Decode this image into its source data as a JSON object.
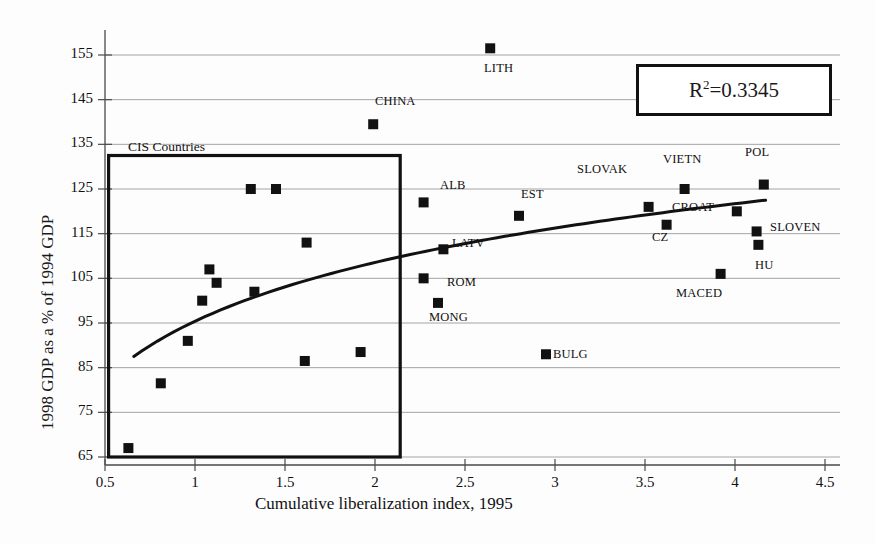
{
  "chart_data": {
    "type": "scatter",
    "title": "",
    "xlabel": "Cumulative liberalization index, 1995",
    "ylabel": "1998 GDP as a % of 1994 GDP",
    "xlim": [
      0.5,
      4.5
    ],
    "ylim": [
      65,
      160
    ],
    "xticks": [
      "0.5",
      "1",
      "1.5",
      "2",
      "2.5",
      "3",
      "3.5",
      "4",
      "4.5"
    ],
    "xtick_values": [
      0.5,
      1,
      1.5,
      2,
      2.5,
      3,
      3.5,
      4,
      4.5
    ],
    "yticks": [
      "65",
      "75",
      "85",
      "95",
      "105",
      "115",
      "125",
      "135",
      "145",
      "155"
    ],
    "ytick_values": [
      65,
      75,
      85,
      95,
      105,
      115,
      125,
      135,
      145,
      155
    ],
    "grid": true,
    "legend": "none",
    "annotations": [
      {
        "name": "r-squared",
        "text": "R²=0.3345",
        "value": 0.3345
      },
      {
        "name": "cis-box-label",
        "text": "CIS Countries"
      }
    ],
    "trendline": {
      "type": "logarithmic",
      "x_start": 0.66,
      "x_end": 4.17,
      "y_start": 87.5,
      "y_end": 122.5,
      "description": "fitted logarithmic trend rising from ~87.5 to ~122.5"
    },
    "highlight_region": {
      "name": "CIS Countries",
      "x_range": [
        0.52,
        2.14
      ],
      "y_range": [
        65,
        132.5
      ]
    },
    "points": [
      {
        "label": "",
        "x": 0.63,
        "y": 67.0
      },
      {
        "label": "",
        "x": 0.81,
        "y": 81.5
      },
      {
        "label": "",
        "x": 0.96,
        "y": 91.0
      },
      {
        "label": "",
        "x": 1.04,
        "y": 100.0
      },
      {
        "label": "",
        "x": 1.08,
        "y": 107.0
      },
      {
        "label": "",
        "x": 1.12,
        "y": 104.0
      },
      {
        "label": "",
        "x": 1.31,
        "y": 125.0
      },
      {
        "label": "",
        "x": 1.33,
        "y": 102.0
      },
      {
        "label": "",
        "x": 1.45,
        "y": 125.0
      },
      {
        "label": "",
        "x": 1.61,
        "y": 86.5
      },
      {
        "label": "",
        "x": 1.62,
        "y": 113.0
      },
      {
        "label": "",
        "x": 1.92,
        "y": 88.5
      },
      {
        "label": "CHINA",
        "x": 1.99,
        "y": 139.5
      },
      {
        "label": "ALB",
        "x": 2.27,
        "y": 122.0
      },
      {
        "label": "ROM",
        "x": 2.27,
        "y": 105.0
      },
      {
        "label": "MONG",
        "x": 2.35,
        "y": 99.5
      },
      {
        "label": "LATV",
        "x": 2.38,
        "y": 111.5
      },
      {
        "label": "LITH",
        "x": 2.64,
        "y": 156.5
      },
      {
        "label": "EST",
        "x": 2.8,
        "y": 119.0
      },
      {
        "label": "BULG",
        "x": 2.95,
        "y": 88.0
      },
      {
        "label": "SLOVAK",
        "x": 3.52,
        "y": 121.0
      },
      {
        "label": "CZ",
        "x": 3.62,
        "y": 117.0
      },
      {
        "label": "VIETN",
        "x": 3.72,
        "y": 125.0
      },
      {
        "label": "MACED",
        "x": 3.92,
        "y": 106.0
      },
      {
        "label": "CROAT",
        "x": 4.01,
        "y": 120.0
      },
      {
        "label": "SLOVEN",
        "x": 4.12,
        "y": 115.5
      },
      {
        "label": "HU",
        "x": 4.13,
        "y": 112.5
      },
      {
        "label": "POL",
        "x": 4.16,
        "y": 126.0
      }
    ],
    "point_labels": [
      {
        "text": "CIS Countries",
        "x_px": 128,
        "y_px": 139
      },
      {
        "text": "LITH",
        "x_px": 484,
        "y_px": 61
      },
      {
        "text": "CHINA",
        "x_px": 375,
        "y_px": 94
      },
      {
        "text": "POL",
        "x_px": 745,
        "y_px": 145
      },
      {
        "text": "SLOVAK",
        "x_px": 577,
        "y_px": 162
      },
      {
        "text": "VIETN",
        "x_px": 663,
        "y_px": 152
      },
      {
        "text": "ALB",
        "x_px": 440,
        "y_px": 178
      },
      {
        "text": "EST",
        "x_px": 521,
        "y_px": 187
      },
      {
        "text": "CROAT",
        "x_px": 672,
        "y_px": 200
      },
      {
        "text": "SLOVEN",
        "x_px": 770,
        "y_px": 220
      },
      {
        "text": "LATV",
        "x_px": 452,
        "y_px": 236
      },
      {
        "text": "CZ",
        "x_px": 652,
        "y_px": 230
      },
      {
        "text": "HU",
        "x_px": 755,
        "y_px": 258
      },
      {
        "text": "ROM",
        "x_px": 447,
        "y_px": 275
      },
      {
        "text": "MACED",
        "x_px": 676,
        "y_px": 286
      },
      {
        "text": "MONG",
        "x_px": 429,
        "y_px": 310
      },
      {
        "text": "BULG",
        "x_px": 553,
        "y_px": 347
      }
    ]
  },
  "style": {
    "marker_color": "#111111",
    "grid_color": "#9a9a9a",
    "axis_color": "#4a4a4a",
    "trend_color": "#111111",
    "box_color": "#111111",
    "background": "#fdfdfd"
  }
}
